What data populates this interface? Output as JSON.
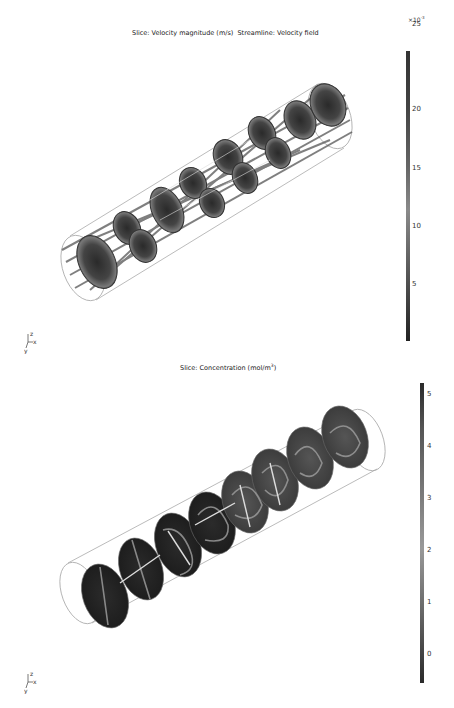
{
  "plots": [
    {
      "title_slice": "Slice: Velocity magnitude (m/s)",
      "title_stream": "Streamline: Velocity field",
      "colorbar": {
        "multiplier": "×10",
        "multiplier_exp": "-3",
        "ticks": [
          "25",
          "20",
          "15",
          "10",
          "5"
        ],
        "colormap": "grayscale",
        "top_color": "#3a3a3a",
        "bottom_color": "#222222"
      },
      "axes_labels": {
        "z": "z",
        "x": "x",
        "y": "y"
      }
    },
    {
      "title_main": "Slice: Concentration (mol/m",
      "title_exp": "3",
      "title_close": ")",
      "colorbar": {
        "ticks": [
          "5",
          "4",
          "3",
          "2",
          "1",
          "0"
        ],
        "colormap": "grayscale",
        "top_color": "#2a2a2a",
        "bottom_color": "#2a2a2a"
      },
      "axes_labels": {
        "z": "z",
        "x": "x",
        "y": "y"
      }
    }
  ]
}
